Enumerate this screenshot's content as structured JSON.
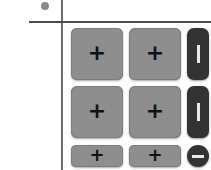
{
  "indicator": {
    "icon": "dot-icon",
    "color": "#8a8a8a"
  },
  "grid": {
    "rows": [
      {
        "buttons": [
          {
            "label": "+",
            "icon": "plus-icon"
          },
          {
            "label": "+",
            "icon": "plus-icon"
          }
        ],
        "toggle": {
          "icon": "vertical-bar-icon",
          "state": "expanded"
        }
      },
      {
        "buttons": [
          {
            "label": "+",
            "icon": "plus-icon"
          },
          {
            "label": "+",
            "icon": "plus-icon"
          }
        ],
        "toggle": {
          "icon": "vertical-bar-icon",
          "state": "expanded"
        }
      },
      {
        "buttons": [
          {
            "label": "+",
            "icon": "plus-icon"
          },
          {
            "label": "+",
            "icon": "plus-icon"
          }
        ],
        "toggle": {
          "icon": "minus-icon",
          "state": "collapsed"
        }
      }
    ]
  },
  "colors": {
    "button": "#8e8e8e",
    "toggle": "#333333",
    "lines": "#4a4a4a"
  }
}
